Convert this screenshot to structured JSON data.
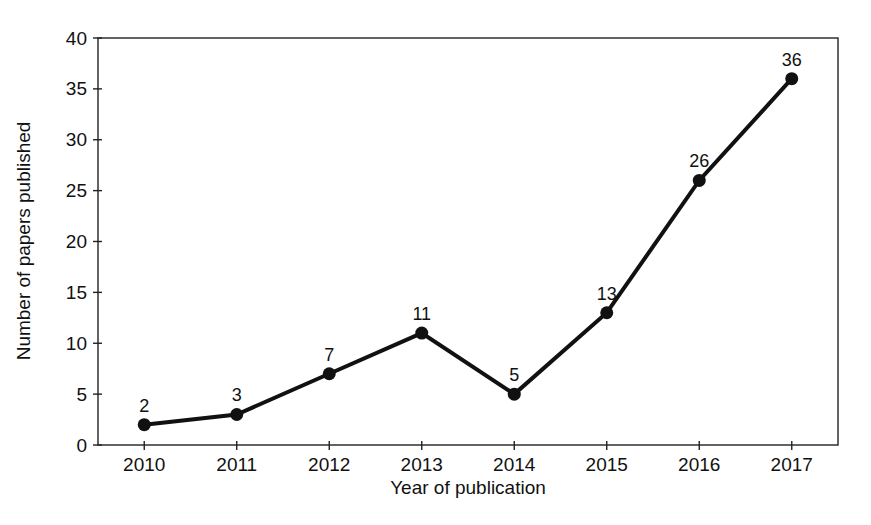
{
  "figure": {
    "background": "#ffffff",
    "ink_color": "#111111",
    "axis_color": "#222222"
  },
  "chart_data": {
    "type": "line",
    "title": "",
    "categories": [
      "2010",
      "2011",
      "2012",
      "2013",
      "2014",
      "2015",
      "2016",
      "2017"
    ],
    "values": [
      2,
      3,
      7,
      11,
      5,
      13,
      26,
      36
    ],
    "point_labels": [
      "2",
      "3",
      "7",
      "11",
      "5",
      "13",
      "26",
      "36"
    ],
    "xlabel": "Year of publication",
    "ylabel": "Number of papers published",
    "ylim": [
      0,
      40
    ],
    "yticks": [
      0,
      5,
      10,
      15,
      20,
      25,
      30,
      35,
      40
    ],
    "grid": false,
    "legend": "none",
    "plot_box": "full-border",
    "marker": "filled-circle",
    "line_color": "#111111",
    "marker_color": "#111111"
  }
}
